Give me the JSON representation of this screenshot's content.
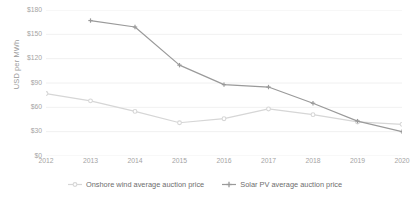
{
  "chart_data": {
    "type": "line",
    "title": "",
    "xlabel": "",
    "ylabel": "USD per MWh",
    "categories": [
      "2012",
      "2013",
      "2014",
      "2015",
      "2016",
      "2017",
      "2018",
      "2019",
      "2020"
    ],
    "ylim": [
      0,
      180
    ],
    "ytick_labels": [
      "$180",
      "$150",
      "$120",
      "$90",
      "$60",
      "$30",
      "$0"
    ],
    "ytick_values": [
      180,
      150,
      120,
      90,
      60,
      30,
      0
    ],
    "grid": true,
    "legend_position": "bottom",
    "series": [
      {
        "name": "Onshore wind average auction price",
        "color": "#d6d6d6",
        "marker": "circle",
        "values": [
          77,
          68,
          55,
          41,
          46,
          58,
          51,
          42,
          39
        ]
      },
      {
        "name": "Solar PV average auction price",
        "color": "#9a9a9a",
        "marker": "cross",
        "values": [
          null,
          167,
          159,
          112,
          88,
          85,
          65,
          43,
          30
        ]
      }
    ]
  },
  "axis": {
    "y_title": "USD per MWh"
  },
  "legend": {
    "items": [
      {
        "label": "Onshore wind average auction price"
      },
      {
        "label": "Solar PV average auction price"
      }
    ]
  },
  "colors": {
    "series_light": "#d6d6d6",
    "series_dark": "#9a9a9a",
    "grid": "#ececec",
    "text": "#a4a4a4"
  }
}
